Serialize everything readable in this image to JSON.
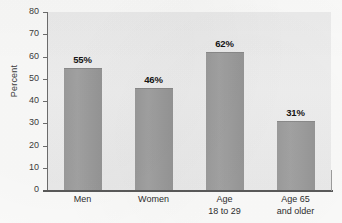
{
  "chart_data": {
    "type": "bar",
    "title": "",
    "xlabel": "",
    "ylabel": "Percent",
    "ylim": [
      0,
      80
    ],
    "ytick_step": 10,
    "grid": false,
    "legend": "none",
    "bar_color": "#9b9b9b",
    "plot_background": "#ededed",
    "categories": [
      {
        "line1": "Men",
        "line2": ""
      },
      {
        "line1": "Women",
        "line2": ""
      },
      {
        "line1": "Age",
        "line2": "18 to 29"
      },
      {
        "line1": "Age 65",
        "line2": "and older"
      }
    ],
    "values": [
      55,
      46,
      62,
      31
    ],
    "value_labels": [
      "55%",
      "46%",
      "62%",
      "31%"
    ],
    "yticks": [
      "0",
      "10",
      "20",
      "30",
      "40",
      "50",
      "60",
      "70",
      "80"
    ]
  }
}
